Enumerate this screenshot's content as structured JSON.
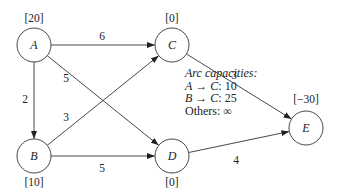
{
  "diagram": {
    "nodes": [
      {
        "id": "A",
        "label": "A",
        "supply": "[20]"
      },
      {
        "id": "B",
        "label": "B",
        "supply": "[10]"
      },
      {
        "id": "C",
        "label": "C",
        "supply": "[0]"
      },
      {
        "id": "D",
        "label": "D",
        "supply": "[0]"
      },
      {
        "id": "E",
        "label": "E",
        "supply": "[−30]"
      }
    ],
    "edges": [
      {
        "from": "A",
        "to": "C",
        "cost": "6"
      },
      {
        "from": "A",
        "to": "D",
        "cost": "5"
      },
      {
        "from": "A",
        "to": "B",
        "cost": "2"
      },
      {
        "from": "B",
        "to": "C",
        "cost": "3"
      },
      {
        "from": "B",
        "to": "D",
        "cost": "5"
      },
      {
        "from": "C",
        "to": "E",
        "cost": "3"
      },
      {
        "from": "D",
        "to": "E",
        "cost": "4"
      }
    ],
    "note": {
      "title": "Arc capacities:",
      "lines": [
        {
          "from": "A",
          "arrow": "→",
          "to": "C",
          "value": ": 10"
        },
        {
          "from": "B",
          "arrow": "→",
          "to": "C",
          "value": ": 25"
        }
      ],
      "others": "Others: ∞"
    }
  }
}
